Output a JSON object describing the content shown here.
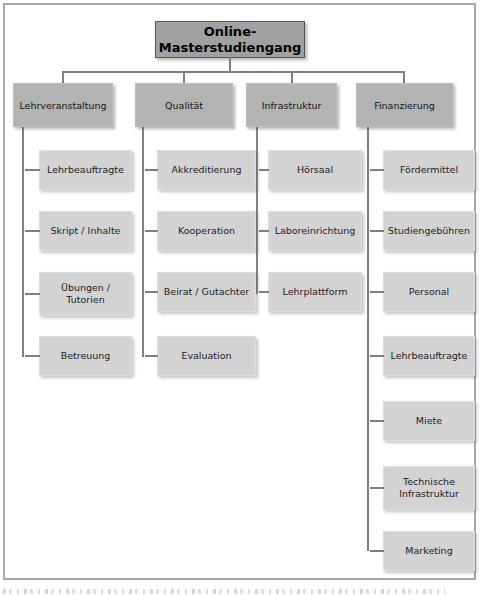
{
  "root": {
    "label": "Online-Masterstudiengang"
  },
  "branches": [
    {
      "label": "Lehrveranstaltung",
      "children": [
        "Lehrbeauftragte",
        "Skript / Inhalte",
        "Übungen / Tutorien",
        "Betreuung"
      ]
    },
    {
      "label": "Qualität",
      "children": [
        "Akkreditierung",
        "Kooperation",
        "Beirat / Gutachter",
        "Evaluation"
      ]
    },
    {
      "label": "Infrastruktur",
      "children": [
        "Hörsaal",
        "Laboreinrichtung",
        "Lehrplattform"
      ]
    },
    {
      "label": "Finanzierung",
      "children": [
        "Fördermittel",
        "Studiengebühren",
        "Personal",
        "Lehrbeauftragte",
        "Miete",
        "Technische Infrastruktur",
        "Marketing"
      ]
    }
  ],
  "colors": {
    "root_fill": "#a1a1a1",
    "branch_fill": "#b3b3b3",
    "child_fill": "#d3d3d3",
    "line": "#7f7f7f",
    "frame_border": "#a8a8a8",
    "text": "#1c1c1c"
  }
}
